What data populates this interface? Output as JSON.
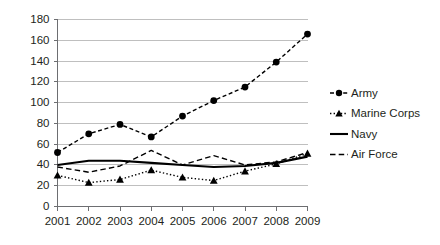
{
  "chart_data": {
    "type": "line",
    "title": "",
    "subtitle": "",
    "xlabel": "",
    "ylabel": "",
    "categories": [
      "2001",
      "2002",
      "2003",
      "2004",
      "2005",
      "2006",
      "2007",
      "2008",
      "2009"
    ],
    "ylim": [
      0,
      180
    ],
    "yticks": [
      0,
      20,
      40,
      60,
      80,
      100,
      120,
      140,
      160,
      180
    ],
    "ytick_labels": [
      "0",
      "20",
      "40",
      "60",
      "80",
      "100",
      "120",
      "140",
      "160",
      "180"
    ],
    "grid": "horizontal",
    "legend_position": "right",
    "series": [
      {
        "name": "Army",
        "line_style": "dashed",
        "marker": "circle",
        "color": "#000000",
        "values": [
          52,
          70,
          79,
          67,
          87,
          102,
          115,
          139,
          166
        ]
      },
      {
        "name": "Marine Corps",
        "line_style": "dotted",
        "marker": "triangle",
        "color": "#000000",
        "values": [
          30,
          23,
          26,
          35,
          28,
          25,
          34,
          41,
          51
        ]
      },
      {
        "name": "Navy",
        "line_style": "solid",
        "marker": "none",
        "color": "#000000",
        "values": [
          40,
          44,
          44,
          42,
          40,
          38,
          39,
          42,
          48
        ]
      },
      {
        "name": "Air Force",
        "line_style": "dashed",
        "marker": "none",
        "color": "#000000",
        "values": [
          38,
          33,
          39,
          54,
          40,
          49,
          40,
          43,
          52
        ]
      }
    ]
  },
  "legend": {
    "items": [
      {
        "label": "Army"
      },
      {
        "label": "Marine Corps"
      },
      {
        "label": "Navy"
      },
      {
        "label": "Air Force"
      }
    ]
  },
  "colors": {
    "background": "#ffffff",
    "gridline": "#bfbfbf",
    "axis": "#6d6e71",
    "text": "#231f20",
    "series": "#000000"
  }
}
